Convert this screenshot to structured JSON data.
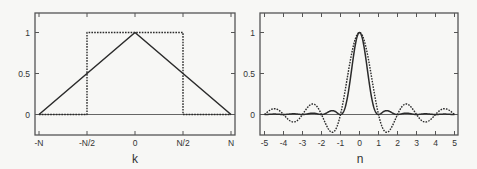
{
  "chart_data": [
    {
      "type": "line",
      "panel": "left",
      "title": "",
      "xlabel": "k",
      "ylabel": "",
      "xlim": [
        -1.04,
        1.04
      ],
      "ylim": [
        -0.24,
        1.24
      ],
      "grid": false,
      "x_ticks": [
        {
          "value": -1,
          "label": "-N"
        },
        {
          "value": -0.5,
          "label": "-N/2"
        },
        {
          "value": 0,
          "label": "0"
        },
        {
          "value": 0.5,
          "label": "N/2"
        },
        {
          "value": 1,
          "label": "N"
        }
      ],
      "y_ticks": [
        {
          "value": 0,
          "label": "0"
        },
        {
          "value": 0.5,
          "label": "0.5"
        },
        {
          "value": 1,
          "label": "1"
        }
      ],
      "series": [
        {
          "name": "triangle window",
          "style": "solid",
          "x": [
            -1,
            0,
            1
          ],
          "y": [
            0,
            1,
            0
          ]
        },
        {
          "name": "rectangular window",
          "style": "dotted",
          "x": [
            -1,
            -0.5,
            -0.5,
            0.5,
            0.5,
            1
          ],
          "y": [
            0,
            0,
            1,
            1,
            0,
            0
          ]
        }
      ],
      "reference_lines": [
        {
          "axis": "y",
          "value": 0
        }
      ]
    },
    {
      "type": "line",
      "panel": "right",
      "title": "",
      "xlabel": "n",
      "ylabel": "",
      "xlim": [
        -5.25,
        5.25
      ],
      "ylim": [
        -0.24,
        1.24
      ],
      "grid": false,
      "x_ticks": [
        {
          "value": -5,
          "label": "-5"
        },
        {
          "value": -4,
          "label": "-4"
        },
        {
          "value": -3,
          "label": "-3"
        },
        {
          "value": -2,
          "label": "-2"
        },
        {
          "value": -1,
          "label": "-1"
        },
        {
          "value": 0,
          "label": "0"
        },
        {
          "value": 1,
          "label": "1"
        },
        {
          "value": 2,
          "label": "2"
        },
        {
          "value": 3,
          "label": "3"
        },
        {
          "value": 4,
          "label": "4"
        },
        {
          "value": 5,
          "label": "5"
        }
      ],
      "y_ticks": [
        {
          "value": 0,
          "label": "0"
        },
        {
          "value": 0.5,
          "label": "0.5"
        },
        {
          "value": 1,
          "label": "1"
        }
      ],
      "series": [
        {
          "name": "sinc squared (transform of triangle)",
          "style": "solid",
          "function": "sinc2",
          "x": [
            -5,
            -4.5,
            -4,
            -3.5,
            -3,
            -2.5,
            -2,
            -1.5,
            -1,
            -0.5,
            0,
            0.5,
            1,
            1.5,
            2,
            2.5,
            3,
            3.5,
            4,
            4.5,
            5
          ],
          "y": [
            0,
            0.005,
            0,
            0.008,
            0,
            0.016,
            0,
            0.045,
            0,
            0.405,
            1,
            0.405,
            0,
            0.045,
            0,
            0.016,
            0,
            0.008,
            0,
            0.005,
            0
          ]
        },
        {
          "name": "sinc (transform of rectangle)",
          "style": "dotted",
          "function": "sinc",
          "x": [
            -5,
            -4.5,
            -4,
            -3.5,
            -3,
            -2.5,
            -2,
            -1.5,
            -1,
            -0.5,
            0,
            0.5,
            1,
            1.5,
            2,
            2.5,
            3,
            3.5,
            4,
            4.5,
            5
          ],
          "y": [
            0,
            0.071,
            0,
            -0.091,
            0,
            0.127,
            0,
            -0.212,
            0,
            0.637,
            1,
            0.637,
            0,
            -0.212,
            0,
            0.127,
            0,
            -0.091,
            0,
            0.071,
            0
          ]
        }
      ],
      "reference_lines": [
        {
          "axis": "y",
          "value": 0
        }
      ]
    }
  ],
  "panels": {
    "left": {
      "xlabel": "k"
    },
    "right": {
      "xlabel": "n"
    }
  },
  "colors": {
    "line": "#2b2b2b",
    "frame": "#555555",
    "background": "#f7f7f5"
  }
}
